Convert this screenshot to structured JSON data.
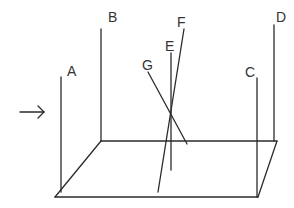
{
  "diagram": {
    "arrow": {
      "label": "",
      "direction": "right"
    },
    "rods": [
      {
        "id": "A",
        "label": "A",
        "orientation": "vertical"
      },
      {
        "id": "B",
        "label": "B",
        "orientation": "vertical"
      },
      {
        "id": "C",
        "label": "C",
        "orientation": "vertical"
      },
      {
        "id": "D",
        "label": "D",
        "orientation": "vertical"
      },
      {
        "id": "E",
        "label": "E",
        "orientation": "vertical"
      },
      {
        "id": "F",
        "label": "F",
        "orientation": "slanted"
      },
      {
        "id": "G",
        "label": "G",
        "orientation": "slanted"
      }
    ],
    "colors": {
      "line": "#2b2b2b",
      "text": "#333333",
      "background": "#ffffff"
    }
  }
}
